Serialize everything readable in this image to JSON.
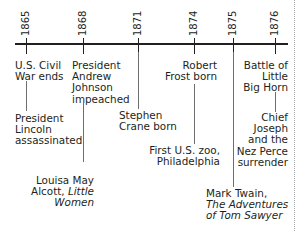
{
  "timeline": {
    "years": [
      {
        "label": "1865",
        "x": 26
      },
      {
        "label": "1868",
        "x": 83
      },
      {
        "label": "1871",
        "x": 138
      },
      {
        "label": "1874",
        "x": 194
      },
      {
        "label": "1875",
        "x": 233
      },
      {
        "label": "1876",
        "x": 275
      }
    ],
    "events": {
      "civil_war": [
        "U.S. Civil",
        "War ends"
      ],
      "lincoln": [
        "President",
        "Lincoln",
        "assassinated"
      ],
      "johnson": [
        "President",
        "Andrew",
        "Johnson",
        "impeached"
      ],
      "alcott": {
        "line1": "Louisa May",
        "line2_plain": "Alcott, ",
        "line2_italic": "Little",
        "line3_italic": "Women"
      },
      "crane": [
        "Stephen",
        "Crane born"
      ],
      "frost": [
        "Robert",
        "Frost born"
      ],
      "zoo": [
        "First U.S. zoo,",
        "Philadelphia"
      ],
      "twain": {
        "line1": "Mark Twain,",
        "line2_italic": "The Adventures",
        "line3_italic": "of Tom Sawyer"
      },
      "little_big_horn": [
        "Battle of",
        "Little",
        "Big Horn"
      ],
      "chief_joseph": [
        "Chief",
        "Joseph",
        "and the",
        "Nez Perce",
        "surrender"
      ]
    }
  },
  "colors": {
    "ink": "#231f20",
    "connector": "#6d6e71",
    "border": "#a7a9ac"
  }
}
